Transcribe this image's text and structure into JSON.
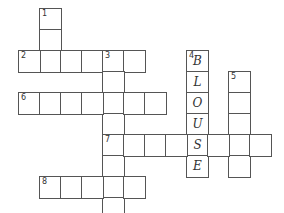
{
  "puzzle": {
    "type": "crossword",
    "cell_size": 21,
    "origin": {
      "x": 19,
      "y": 9
    },
    "entries": [
      {
        "number": "1",
        "direction": "down",
        "col": 1,
        "row": 0,
        "length": 3,
        "letters": [
          "",
          "",
          ""
        ]
      },
      {
        "number": "2",
        "direction": "across",
        "col": 0,
        "row": 2,
        "length": 6,
        "letters": [
          "",
          "",
          "",
          "",
          "",
          ""
        ]
      },
      {
        "number": "3",
        "direction": "down",
        "col": 4,
        "row": 2,
        "length": 8,
        "letters": [
          "",
          "",
          "",
          "",
          "",
          "",
          "",
          ""
        ]
      },
      {
        "number": "4",
        "direction": "down",
        "col": 8,
        "row": 2,
        "length": 6,
        "letters": [
          "B",
          "L",
          "O",
          "U",
          "S",
          "E"
        ]
      },
      {
        "number": "5",
        "direction": "down",
        "col": 10,
        "row": 3,
        "length": 5,
        "letters": [
          "",
          "",
          "",
          "",
          ""
        ]
      },
      {
        "number": "6",
        "direction": "across",
        "col": 0,
        "row": 4,
        "length": 7,
        "letters": [
          "",
          "",
          "",
          "",
          "",
          "",
          ""
        ]
      },
      {
        "number": "7",
        "direction": "across",
        "col": 4,
        "row": 6,
        "length": 8,
        "letters": [
          "",
          "",
          "",
          "",
          "S",
          "",
          "",
          ""
        ]
      },
      {
        "number": "8",
        "direction": "across",
        "col": 1,
        "row": 8,
        "length": 5,
        "letters": [
          "",
          "",
          "",
          "",
          ""
        ]
      }
    ]
  }
}
